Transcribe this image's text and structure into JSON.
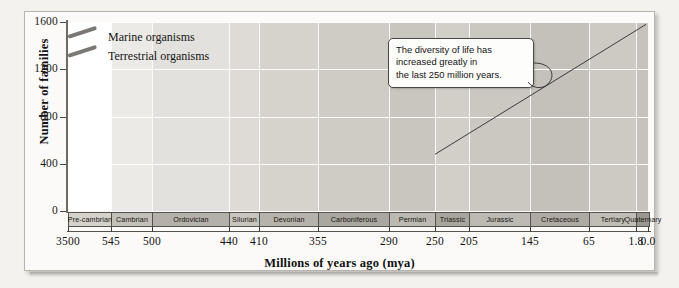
{
  "chart_data": {
    "type": "line",
    "title": "",
    "xlabel": "Millions of years ago (mya)",
    "ylabel": "Number of families",
    "xlim": [
      3500,
      0
    ],
    "ylim": [
      0,
      1600
    ],
    "grid": true,
    "legend_position": "top-left",
    "y_ticks": [
      0,
      400,
      800,
      1200,
      1600
    ],
    "x_ticks": [
      "3500",
      "545",
      "500",
      "440",
      "410",
      "355",
      "290",
      "250",
      "205",
      "145",
      "65",
      "1.8",
      "0.0"
    ],
    "x_tick_values": [
      3500,
      545,
      500,
      440,
      410,
      355,
      290,
      250,
      205,
      145,
      65,
      1.8,
      0.0
    ],
    "periods": [
      {
        "label": "Pre-cambrian",
        "start": 3500,
        "end": 545
      },
      {
        "label": "Cambrian",
        "start": 545,
        "end": 500
      },
      {
        "label": "Ordovician",
        "start": 500,
        "end": 440
      },
      {
        "label": "Silurian",
        "start": 440,
        "end": 410
      },
      {
        "label": "Devonian",
        "start": 410,
        "end": 355
      },
      {
        "label": "Carboniferous",
        "start": 355,
        "end": 290
      },
      {
        "label": "Permian",
        "start": 290,
        "end": 250
      },
      {
        "label": "Triassic",
        "start": 250,
        "end": 205
      },
      {
        "label": "Jurassic",
        "start": 205,
        "end": 145
      },
      {
        "label": "Cretaceous",
        "start": 145,
        "end": 65
      },
      {
        "label": "Tertiary",
        "start": 65,
        "end": 1.8
      },
      {
        "label": "Quaternary",
        "start": 1.8,
        "end": 0.0
      }
    ],
    "series": [
      {
        "name": "Marine organisms",
        "color": "#7b7873",
        "points": [
          [
            3500,
            0
          ],
          [
            1100,
            120
          ],
          [
            700,
            230
          ],
          [
            560,
            300
          ],
          [
            545,
            318
          ],
          [
            530,
            300
          ],
          [
            515,
            272
          ],
          [
            505,
            245
          ],
          [
            500,
            222
          ],
          [
            492,
            198
          ],
          [
            486,
            186
          ],
          [
            480,
            190
          ],
          [
            472,
            210
          ],
          [
            466,
            232
          ],
          [
            460,
            262
          ],
          [
            455,
            300
          ],
          [
            450,
            330
          ],
          [
            444,
            372
          ],
          [
            440,
            408
          ],
          [
            434,
            440
          ],
          [
            428,
            466
          ],
          [
            424,
            486
          ],
          [
            418,
            490
          ],
          [
            412,
            478
          ],
          [
            408,
            462
          ],
          [
            404,
            452
          ],
          [
            400,
            470
          ],
          [
            394,
            474
          ],
          [
            388,
            462
          ],
          [
            380,
            452
          ],
          [
            372,
            456
          ],
          [
            364,
            470
          ],
          [
            358,
            484
          ],
          [
            352,
            478
          ],
          [
            344,
            462
          ],
          [
            336,
            458
          ],
          [
            328,
            460
          ],
          [
            320,
            452
          ],
          [
            312,
            444
          ],
          [
            304,
            444
          ],
          [
            296,
            452
          ],
          [
            290,
            462
          ],
          [
            284,
            450
          ],
          [
            276,
            434
          ],
          [
            268,
            424
          ],
          [
            262,
            420
          ],
          [
            256,
            416
          ],
          [
            252,
            404
          ],
          [
            250,
            372
          ],
          [
            249,
            290
          ],
          [
            248,
            206
          ],
          [
            250,
            158
          ],
          [
            251,
            210
          ],
          [
            252,
            268
          ],
          [
            254,
            306
          ],
          [
            250,
            330
          ],
          [
            244,
            332
          ],
          [
            236,
            330
          ],
          [
            228,
            336
          ],
          [
            220,
            342
          ],
          [
            212,
            348
          ],
          [
            205,
            352
          ],
          [
            196,
            350
          ],
          [
            188,
            344
          ],
          [
            180,
            342
          ],
          [
            172,
            346
          ],
          [
            164,
            354
          ],
          [
            156,
            346
          ],
          [
            148,
            332
          ],
          [
            142,
            330
          ],
          [
            138,
            344
          ],
          [
            132,
            392
          ],
          [
            126,
            420
          ],
          [
            120,
            440
          ],
          [
            112,
            452
          ],
          [
            104,
            470
          ],
          [
            96,
            500
          ],
          [
            88,
            534
          ],
          [
            80,
            570
          ],
          [
            74,
            616
          ],
          [
            70,
            660
          ],
          [
            66,
            700
          ],
          [
            62,
            740
          ],
          [
            56,
            800
          ],
          [
            50,
            872
          ],
          [
            44,
            940
          ],
          [
            38,
            1000
          ],
          [
            32,
            1048
          ],
          [
            24,
            1086
          ],
          [
            16,
            1112
          ],
          [
            8,
            1126
          ],
          [
            2,
            1134
          ],
          [
            0,
            1132
          ]
        ]
      },
      {
        "name": "Terrestrial organisms",
        "color": "#7b7873",
        "points": [
          [
            3500,
            0
          ],
          [
            1100,
            120
          ],
          [
            700,
            230
          ],
          [
            560,
            300
          ],
          [
            545,
            318
          ],
          [
            530,
            300
          ],
          [
            515,
            272
          ],
          [
            505,
            245
          ],
          [
            500,
            222
          ],
          [
            492,
            198
          ],
          [
            486,
            186
          ],
          [
            480,
            190
          ],
          [
            472,
            210
          ],
          [
            466,
            232
          ],
          [
            460,
            262
          ],
          [
            455,
            300
          ],
          [
            450,
            330
          ],
          [
            444,
            372
          ],
          [
            440,
            408
          ],
          [
            434,
            440
          ],
          [
            428,
            466
          ],
          [
            424,
            486
          ],
          [
            418,
            490
          ],
          [
            412,
            478
          ],
          [
            408,
            462
          ],
          [
            404,
            452
          ],
          [
            400,
            470
          ],
          [
            394,
            474
          ],
          [
            388,
            462
          ],
          [
            380,
            452
          ],
          [
            372,
            456
          ],
          [
            364,
            470
          ],
          [
            358,
            484
          ],
          [
            352,
            478
          ],
          [
            344,
            462
          ],
          [
            336,
            458
          ],
          [
            328,
            460
          ],
          [
            320,
            452
          ],
          [
            312,
            444
          ],
          [
            304,
            444
          ],
          [
            296,
            452
          ],
          [
            290,
            462
          ],
          [
            284,
            450
          ],
          [
            276,
            434
          ],
          [
            268,
            424
          ],
          [
            262,
            420
          ],
          [
            256,
            416
          ],
          [
            252,
            404
          ],
          [
            250,
            372
          ],
          [
            249,
            290
          ],
          [
            248,
            206
          ],
          [
            250,
            158
          ],
          [
            251,
            210
          ],
          [
            252,
            268
          ],
          [
            254,
            306
          ],
          [
            250,
            330
          ],
          [
            244,
            332
          ],
          [
            236,
            330
          ],
          [
            228,
            336
          ],
          [
            220,
            342
          ],
          [
            212,
            348
          ],
          [
            205,
            352
          ],
          [
            196,
            350
          ],
          [
            188,
            344
          ],
          [
            180,
            342
          ],
          [
            172,
            346
          ],
          [
            164,
            354
          ],
          [
            156,
            346
          ],
          [
            148,
            332
          ],
          [
            142,
            330
          ],
          [
            138,
            344
          ],
          [
            132,
            392
          ],
          [
            126,
            420
          ],
          [
            120,
            440
          ],
          [
            112,
            452
          ],
          [
            104,
            470
          ],
          [
            96,
            500
          ],
          [
            88,
            534
          ],
          [
            80,
            570
          ],
          [
            74,
            616
          ],
          [
            70,
            660
          ],
          [
            66,
            700
          ],
          [
            62,
            740
          ],
          [
            56,
            800
          ],
          [
            50,
            872
          ],
          [
            44,
            940
          ],
          [
            38,
            1000
          ],
          [
            32,
            1048
          ],
          [
            24,
            1086
          ],
          [
            16,
            1112
          ],
          [
            8,
            1126
          ],
          [
            2,
            1134
          ],
          [
            0,
            1132
          ]
        ]
      }
    ],
    "annotations": [
      {
        "name": "diversity-callout",
        "lines": [
          "The diversity of life has",
          "increased greatly in",
          "the last 250 million years."
        ]
      }
    ],
    "trend_line": {
      "from": [
        250,
        480
      ],
      "to": [
        0,
        1580
      ]
    }
  },
  "legend": {
    "items": [
      {
        "label": "Marine organisms"
      },
      {
        "label": "Terrestrial organisms"
      }
    ]
  },
  "colors": {
    "curve": "#7b7873",
    "axis": "#4a4742",
    "band_light": "#ebeae7",
    "band_dark": "#cfccc6",
    "period_bar": "#c9c6c0",
    "period_bar_dark": "#a8a49d"
  }
}
